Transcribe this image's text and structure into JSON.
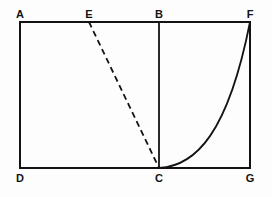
{
  "figure": {
    "title": "",
    "background_color": "#fdfdfd",
    "stroke_color": "#131313",
    "labels": [
      {
        "name": "A",
        "text": "A",
        "x": 20,
        "y": 22,
        "position": "above-left"
      },
      {
        "name": "E",
        "text": "E",
        "x": 89,
        "y": 22,
        "position": "above"
      },
      {
        "name": "B",
        "text": "B",
        "x": 159,
        "y": 22,
        "position": "above"
      },
      {
        "name": "F",
        "text": "F",
        "x": 250,
        "y": 22,
        "position": "above-right"
      },
      {
        "name": "D",
        "text": "D",
        "x": 20,
        "y": 168,
        "position": "below-left"
      },
      {
        "name": "C",
        "text": "C",
        "x": 159,
        "y": 168,
        "position": "below"
      },
      {
        "name": "G",
        "text": "G",
        "x": 250,
        "y": 168,
        "position": "below-right"
      }
    ],
    "rectangle": {
      "name": "outer-rectangle",
      "left": 20,
      "top": 22,
      "right": 250,
      "bottom": 168,
      "stroke_width": 2
    },
    "segments": [
      {
        "name": "segment-BC",
        "from": "B",
        "to": "C",
        "x1": 159,
        "y1": 22,
        "x2": 159,
        "y2": 168,
        "style": "solid",
        "stroke_width": 1.8
      },
      {
        "name": "segment-EC",
        "from": "E",
        "to": "C",
        "x1": 89,
        "y1": 22,
        "x2": 159,
        "y2": 168,
        "style": "dashed",
        "dash_pattern": "6 4",
        "stroke_width": 1.8
      }
    ],
    "curve": {
      "name": "curve-CF",
      "from": "C",
      "to": "F",
      "shape": "concave-up",
      "path": "M 159 168 C 196 166 228 133 250 22",
      "stroke_width": 1.8
    }
  }
}
